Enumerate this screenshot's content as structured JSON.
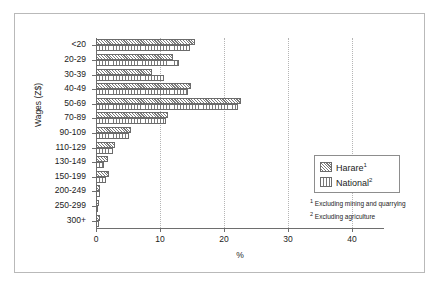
{
  "chart_data": {
    "type": "bar",
    "orientation": "horizontal",
    "title": "",
    "xlabel": "%",
    "ylabel": "Wages (Z$)",
    "xlim": [
      0,
      45
    ],
    "xticks": [
      0,
      10,
      20,
      30,
      40
    ],
    "xtick_labels": [
      "0",
      "10",
      "20",
      "30",
      "40"
    ],
    "grid": "vertical-dotted",
    "legend_position": "center-right",
    "categories": [
      "<20",
      "20-29",
      "30-39",
      "40-49",
      "50-69",
      "70-89",
      "90-109",
      "110-129",
      "130-149",
      "150-199",
      "200-249",
      "250-299",
      "300+"
    ],
    "series": [
      {
        "name": "Harare",
        "footnote_marker": "1",
        "pattern": "diagonal-hatch",
        "values": [
          15.5,
          12.0,
          8.8,
          14.8,
          22.6,
          11.2,
          5.4,
          3.0,
          1.8,
          2.1,
          0.7,
          0.5,
          0.6
        ]
      },
      {
        "name": "National",
        "footnote_marker": "2",
        "pattern": "vertical-hatch",
        "values": [
          14.7,
          13.0,
          10.6,
          14.4,
          22.2,
          10.9,
          5.2,
          2.6,
          1.3,
          1.6,
          0.6,
          0.3,
          0.5
        ]
      }
    ]
  },
  "legend": {
    "entries": [
      {
        "label": "Harare",
        "marker": "1"
      },
      {
        "label": "National",
        "marker": "2"
      }
    ]
  },
  "footnotes": [
    {
      "marker": "1",
      "text": "Excluding mining and quarrying"
    },
    {
      "marker": "2",
      "text": "Excluding agriculture"
    }
  ]
}
